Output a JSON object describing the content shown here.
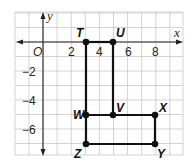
{
  "diagram": {
    "grid": {
      "x_min": -2,
      "x_max": 9.7,
      "y_min": -7.8,
      "y_max": 2,
      "step": 1,
      "color": "#c8c8c8"
    },
    "axes": {
      "x_label": "x",
      "y_label": "y",
      "origin_label": "O"
    },
    "x_ticks": [
      {
        "value": 2,
        "label": "2"
      },
      {
        "value": 4,
        "label": "4"
      },
      {
        "value": 6,
        "label": "6"
      },
      {
        "value": 8,
        "label": "8"
      }
    ],
    "y_ticks": [
      {
        "value": -2,
        "label": "−2"
      },
      {
        "value": -4,
        "label": "−4"
      },
      {
        "value": -6,
        "label": "−6"
      }
    ],
    "points": [
      {
        "name": "T",
        "x": 3,
        "y": 0
      },
      {
        "name": "U",
        "x": 5,
        "y": 0
      },
      {
        "name": "V",
        "x": 5,
        "y": -5
      },
      {
        "name": "W",
        "x": 3,
        "y": -5
      },
      {
        "name": "X",
        "x": 8,
        "y": -5
      },
      {
        "name": "Y",
        "x": 8,
        "y": -7
      },
      {
        "name": "Z",
        "x": 3,
        "y": -7
      }
    ],
    "segments": [
      [
        "T",
        "U"
      ],
      [
        "U",
        "V"
      ],
      [
        "V",
        "X"
      ],
      [
        "X",
        "Y"
      ],
      [
        "Y",
        "Z"
      ],
      [
        "Z",
        "W"
      ],
      [
        "W",
        "T"
      ],
      [
        "W",
        "V"
      ]
    ],
    "labels": {
      "T": "T",
      "U": "U",
      "V": "V",
      "W": "W",
      "X": "X",
      "Y": "Y",
      "Z": "Z"
    }
  }
}
